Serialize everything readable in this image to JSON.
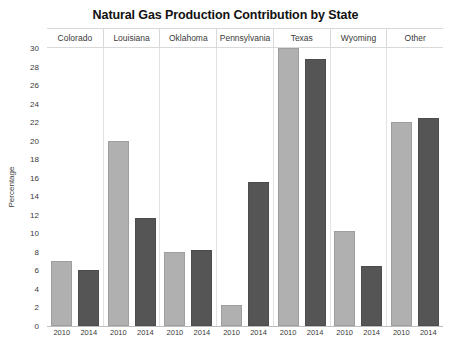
{
  "chart_data": {
    "type": "bar",
    "title": "Natural Gas Production Contribution by State",
    "xlabel": "",
    "ylabel": "Percentage",
    "ylim": [
      0,
      30
    ],
    "ytick_step": 2,
    "yticks": [
      30,
      28,
      26,
      24,
      22,
      20,
      18,
      16,
      14,
      12,
      10,
      8,
      6,
      4,
      2,
      0
    ],
    "grid": false,
    "legend_position": "none",
    "categories": [
      "Colorado",
      "Louisiana",
      "Oklahoma",
      "Pennsylvania",
      "Texas",
      "Wyoming",
      "Other"
    ],
    "series": [
      {
        "name": "2010",
        "color": "#b0b0b0",
        "values": [
          7.0,
          20.0,
          8.0,
          2.3,
          30.0,
          10.3,
          22.0
        ]
      },
      {
        "name": "2014",
        "color": "#555555",
        "values": [
          6.0,
          11.7,
          8.2,
          15.5,
          28.8,
          6.5,
          22.5
        ]
      }
    ],
    "x_tick_labels": [
      "2010",
      "2014",
      "2010",
      "2014",
      "2010",
      "2014",
      "2010",
      "2014",
      "2010",
      "2014",
      "2010",
      "2014",
      "2010",
      "2014"
    ]
  }
}
